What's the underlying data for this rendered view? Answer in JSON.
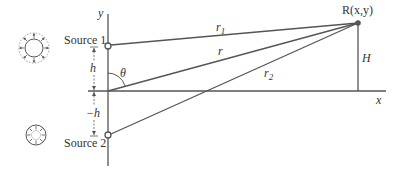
{
  "diagram": {
    "colors": {
      "line": "#555555",
      "text": "#333333",
      "background": "#ffffff"
    },
    "axes": {
      "x_label": "x",
      "y_label": "y"
    },
    "sources": [
      {
        "label": "Source 1",
        "icon": "expanding-wave-icon",
        "height_label": "h"
      },
      {
        "label": "Source 2",
        "icon": "contracting-wave-icon",
        "height_label": "−h"
      }
    ],
    "receiver": {
      "label": "R(x,y)",
      "height_label": "H"
    },
    "distances": {
      "r1": "r",
      "r1_sub": "1",
      "r": "r",
      "r2": "r",
      "r2_sub": "2"
    },
    "angle_label": "θ"
  }
}
